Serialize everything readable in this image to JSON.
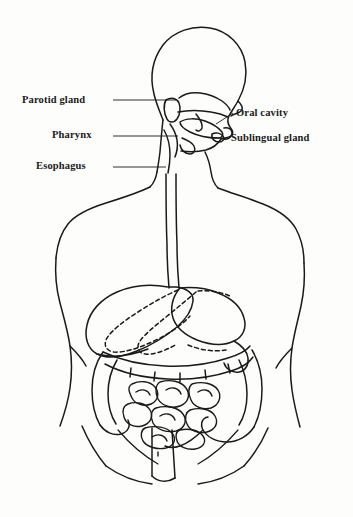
{
  "figure": {
    "type": "anatomical-line-diagram",
    "view": "anterior torso with mid-sagittal head section",
    "background_color": "#fdfdfc",
    "ink_color": "#1a1a1a",
    "width": 353,
    "height": 517
  },
  "labels": {
    "parotid_gland": "Parotid gland",
    "pharynx": "Pharynx",
    "esophagus": "Esophagus",
    "oral_cavity": "Oral cavity",
    "sublingual_gland": "Sublingual gland"
  },
  "label_layout": {
    "left_side": [
      "Parotid gland",
      "Pharynx",
      "Esophagus"
    ],
    "right_side": [
      "Oral cavity",
      "Sublingual gland"
    ],
    "leader_line_style": "thin solid horizontal rule"
  },
  "structures": {
    "unlabeled_visible": [
      "head profile",
      "nasal cavity",
      "tongue",
      "mandible",
      "neck",
      "shoulders",
      "torso outline",
      "liver",
      "stomach",
      "transverse colon",
      "ascending colon",
      "descending colon",
      "small intestine",
      "pelvis"
    ],
    "dashed_outline": "stomach silhouette hidden behind liver"
  }
}
